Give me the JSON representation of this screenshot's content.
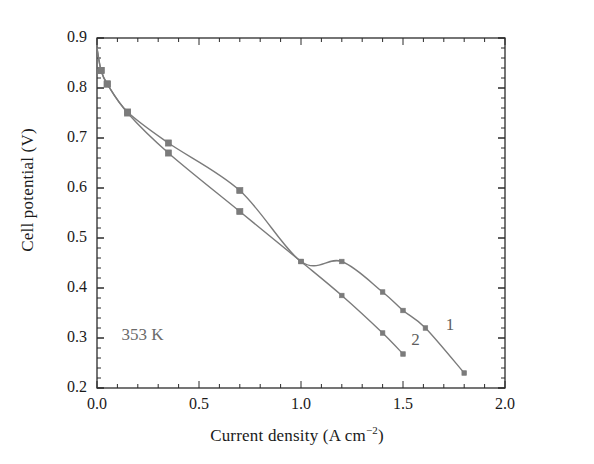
{
  "chart_data": {
    "type": "line",
    "title": "",
    "xlabel": "Current density (A cm−2)",
    "ylabel": "Cell potential (V)",
    "xlim": [
      0.0,
      2.0
    ],
    "ylim": [
      0.2,
      0.9
    ],
    "xticks": [
      "0.0",
      "0.5",
      "1.0",
      "1.5",
      "2.0"
    ],
    "xtick_values": [
      0.0,
      0.5,
      1.0,
      1.5,
      2.0
    ],
    "yticks": [
      "0.2",
      "0.3",
      "0.4",
      "0.5",
      "0.6",
      "0.7",
      "0.8",
      "0.9"
    ],
    "ytick_values": [
      0.2,
      0.3,
      0.4,
      0.5,
      0.6,
      0.7,
      0.8,
      0.9
    ],
    "xminor_step": 0.1,
    "yminor_step": 0.02,
    "grid": false,
    "legend": "inline-curve-labels",
    "annotations": [
      {
        "text": "353 K",
        "x": 0.12,
        "y": 0.305
      },
      {
        "text": "1",
        "x": 1.71,
        "y": 0.325
      },
      {
        "text": "2",
        "x": 1.54,
        "y": 0.295
      }
    ],
    "series": [
      {
        "name": "1",
        "label": "1",
        "color": "#7b7b7b",
        "marker": "square",
        "x": [
          0.0,
          0.02,
          0.05,
          0.15,
          0.35,
          0.7,
          1.0,
          1.2,
          1.4,
          1.5,
          1.61,
          1.8
        ],
        "y": [
          0.88,
          0.835,
          0.808,
          0.752,
          0.69,
          0.595,
          0.453,
          0.453,
          0.392,
          0.355,
          0.32,
          0.23
        ]
      },
      {
        "name": "2",
        "label": "2",
        "color": "#7b7b7b",
        "marker": "square",
        "x": [
          0.0,
          0.02,
          0.05,
          0.15,
          0.35,
          0.7,
          1.0,
          1.2,
          1.4,
          1.5
        ],
        "y": [
          0.88,
          0.835,
          0.808,
          0.75,
          0.67,
          0.553,
          0.453,
          0.385,
          0.31,
          0.268
        ]
      }
    ]
  },
  "axes": {
    "xlabel_main": "Current density (A cm",
    "xlabel_sup": "−2",
    "xlabel_close": ")",
    "ylabel": "Cell potential (V)"
  },
  "curve_labels": {
    "one": "1",
    "two": "2"
  },
  "temperature": "353 K"
}
